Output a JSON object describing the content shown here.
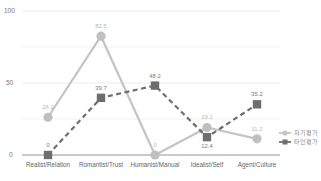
{
  "chart_data": {
    "type": "line",
    "title": "",
    "xlabel": "",
    "ylabel": "",
    "ylim": [
      0,
      100
    ],
    "yticks": [
      "0",
      "50",
      "100"
    ],
    "grid": true,
    "legend_position": "right",
    "categories": [
      "Realist/Relation",
      "Romantist/Trust",
      "Humanist/Manual",
      "Idealist/Self",
      "Agent/Culture"
    ],
    "series": [
      {
        "name": "자기평가",
        "values": [
          26.2,
          82.5,
          0,
          19.1,
          11.2
        ],
        "labels": [
          "26.2",
          "82.5",
          "0",
          "19.1",
          "11.2"
        ],
        "color": "#c0c0c0",
        "marker": "circle",
        "line": "solid"
      },
      {
        "name": "타인평가",
        "values": [
          0,
          39.7,
          48.2,
          12.4,
          35.2
        ],
        "labels": [
          "0",
          "39.7",
          "48.2",
          "12.4",
          "35.2"
        ],
        "color": "#6e6e6e",
        "marker": "square",
        "line": "dashed"
      }
    ]
  },
  "axis": {
    "y100": "100",
    "y50": "50",
    "y0": "0"
  },
  "legend": {
    "items": [
      {
        "label": "자기평가",
        "icon": "circle-line-icon"
      },
      {
        "label": "타인평가",
        "icon": "square-dashed-line-icon"
      }
    ]
  }
}
